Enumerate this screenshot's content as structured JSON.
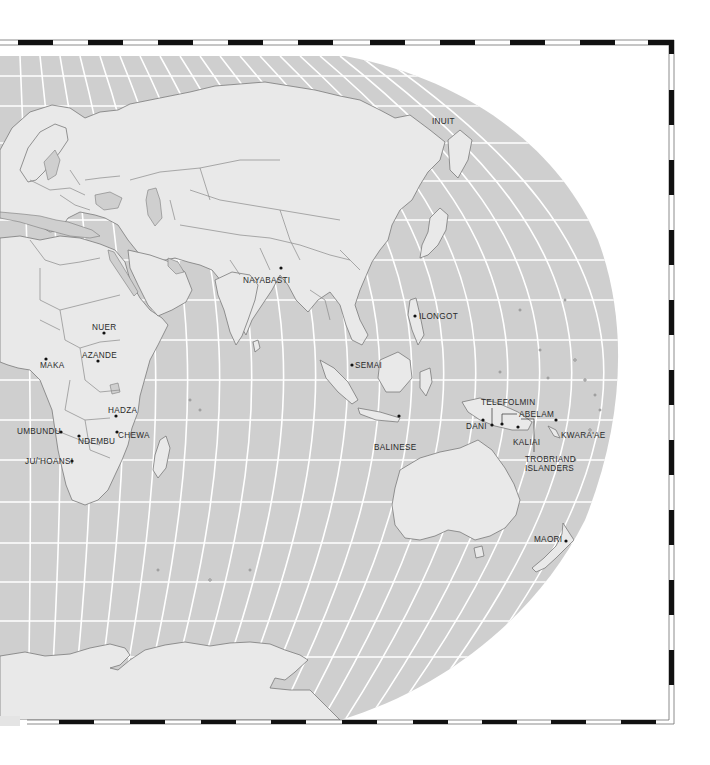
{
  "map": {
    "type": "world-map-eastern-hemisphere",
    "projection": "pseudo-elliptical (Robinson-like), right half",
    "colors": {
      "ocean": "#cfcfcf",
      "land": "#e9e9e9",
      "coastline": "#7a7a7a",
      "graticule": "#ffffff",
      "frame_dash": "#111111",
      "label_text": "#2a2a2a"
    },
    "labels": [
      {
        "name": "INUIT",
        "x": 423,
        "y": 123
      },
      {
        "name": "NAYABASTI",
        "x": 243,
        "y": 282
      },
      {
        "name": "ILONGOT",
        "x": 418,
        "y": 318
      },
      {
        "name": "NUER",
        "x": 92,
        "y": 329
      },
      {
        "name": "AZANDE",
        "x": 82,
        "y": 358
      },
      {
        "name": "MAKA",
        "x": 40,
        "y": 367
      },
      {
        "name": "SEMAI",
        "x": 354,
        "y": 366
      },
      {
        "name": "TELEFOLMIN",
        "x": 481,
        "y": 404
      },
      {
        "name": "ABELAM",
        "x": 518,
        "y": 416
      },
      {
        "name": "DANI",
        "x": 466,
        "y": 428
      },
      {
        "name": "HADZA",
        "x": 108,
        "y": 413
      },
      {
        "name": "KALIAI",
        "x": 513,
        "y": 444
      },
      {
        "name": "KWARA'AE",
        "x": 560,
        "y": 437
      },
      {
        "name": "BALINESE",
        "x": 374,
        "y": 449
      },
      {
        "name": "UMBUNDU",
        "x": 17,
        "y": 433
      },
      {
        "name": "NDEMBU",
        "x": 78,
        "y": 443
      },
      {
        "name": "CHEWA",
        "x": 118,
        "y": 437
      },
      {
        "name": "TROBRIAND",
        "x": 525,
        "y": 461
      },
      {
        "name": "ISLANDERS",
        "x": 525,
        "y": 470
      },
      {
        "name": "JU/'HOANSI",
        "x": 25,
        "y": 463
      },
      {
        "name": "MAORI",
        "x": 534,
        "y": 541
      }
    ]
  }
}
